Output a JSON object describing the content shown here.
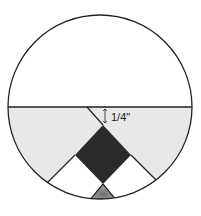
{
  "diagram": {
    "annotation": "1/4\"",
    "colors": {
      "outline": "#222222",
      "upper_fill": "#ffffff",
      "side_fill": "#e6e6e6",
      "diamond_fill": "#2b2b2b",
      "white_fill": "#ffffff",
      "triangle_fill": "#8a8a8a"
    }
  }
}
